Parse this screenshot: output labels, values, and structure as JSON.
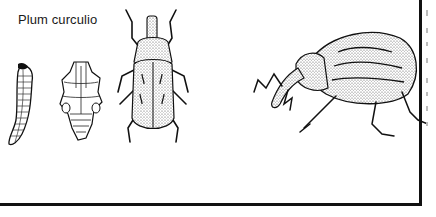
{
  "figure": {
    "caption": "Plum curculio",
    "panels": [
      {
        "id": "larva",
        "label": "larva"
      },
      {
        "id": "pupa",
        "label": "pupa"
      },
      {
        "id": "adult-dorsal",
        "label": "adult (dorsal view)"
      },
      {
        "id": "adult-lateral",
        "label": "adult (side view)"
      }
    ]
  },
  "colors": {
    "ink": "#111111",
    "paper": "#ffffff"
  }
}
